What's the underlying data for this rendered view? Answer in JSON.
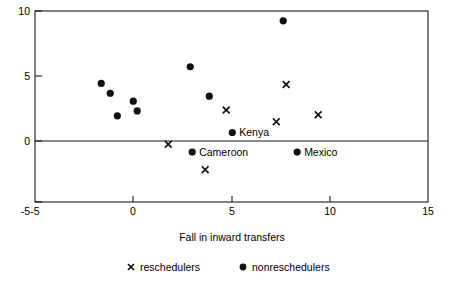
{
  "chart_data": {
    "type": "scatter",
    "title": "",
    "xlabel": "Fall in inward transfers",
    "ylabel": "",
    "xlim": [
      -5,
      15
    ],
    "ylim": [
      -5,
      10
    ],
    "xticks": [
      -5,
      0,
      5,
      10,
      15
    ],
    "yticks": [
      -5,
      0,
      5,
      10
    ],
    "xtick_labels": [
      "-5",
      "0",
      "5",
      "10",
      "15"
    ],
    "ytick_labels": [
      "-5",
      "0",
      "5",
      "10"
    ],
    "grid": false,
    "zero_line": true,
    "legend_position": "bottom",
    "series": [
      {
        "name": "reschedulers",
        "marker": "x",
        "color": "#111111",
        "points": [
          {
            "x": 1.78,
            "y": -0.46,
            "label": ""
          },
          {
            "x": 3.66,
            "y": -2.46,
            "label": ""
          },
          {
            "x": 4.73,
            "y": 2.23,
            "label": ""
          },
          {
            "x": 7.78,
            "y": 4.23,
            "label": ""
          },
          {
            "x": 7.28,
            "y": 1.31,
            "label": ""
          },
          {
            "x": 9.41,
            "y": 1.85,
            "label": ""
          }
        ]
      },
      {
        "name": "nonreschedulers",
        "marker": "dot",
        "color": "#111111",
        "points": [
          {
            "x": -1.63,
            "y": 4.31,
            "label": ""
          },
          {
            "x": -1.17,
            "y": 3.54,
            "label": ""
          },
          {
            "x": -0.81,
            "y": 1.77,
            "label": ""
          },
          {
            "x": 0.0,
            "y": 2.92,
            "label": ""
          },
          {
            "x": 0.2,
            "y": 2.15,
            "label": ""
          },
          {
            "x": 2.9,
            "y": 5.62,
            "label": ""
          },
          {
            "x": 3.87,
            "y": 3.31,
            "label": ""
          },
          {
            "x": 7.63,
            "y": 9.23,
            "label": ""
          },
          {
            "x": 5.04,
            "y": 0.46,
            "label": "Kenya"
          },
          {
            "x": 3.0,
            "y": -1.08,
            "label": "Cameroon"
          },
          {
            "x": 8.34,
            "y": -1.08,
            "label": "Mexico"
          }
        ]
      }
    ],
    "annotations": [
      {
        "text": "Kenya",
        "x": 5.04,
        "y": 0.46
      },
      {
        "text": "Cameroon",
        "x": 3.0,
        "y": -1.08
      },
      {
        "text": "Mexico",
        "x": 8.34,
        "y": -1.08
      }
    ]
  },
  "legend": {
    "items": [
      {
        "label": "reschedulers",
        "marker": "x-marker-icon"
      },
      {
        "label": "nonreschedulers",
        "marker": "dot-marker-icon"
      }
    ]
  },
  "axis": {
    "x_title": "Fall in inward transfers"
  }
}
